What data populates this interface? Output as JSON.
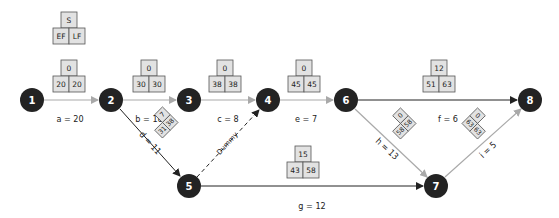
{
  "legend": {
    "top": "S",
    "left": "EF",
    "right": "LF"
  },
  "colors": {
    "node": "#232323",
    "edge_dark": "#222222",
    "edge_gray": "#a9a9a9",
    "box_fill": "#e2e2e2"
  },
  "nodes": [
    {
      "id": "1",
      "label": "1",
      "x": 32,
      "y": 100
    },
    {
      "id": "2",
      "label": "2",
      "x": 111,
      "y": 100
    },
    {
      "id": "3",
      "label": "3",
      "x": 189,
      "y": 100
    },
    {
      "id": "4",
      "label": "4",
      "x": 268,
      "y": 100
    },
    {
      "id": "5",
      "label": "5",
      "x": 189,
      "y": 186
    },
    {
      "id": "6",
      "label": "6",
      "x": 346,
      "y": 100
    },
    {
      "id": "7",
      "label": "7",
      "x": 436,
      "y": 186
    },
    {
      "id": "8",
      "label": "8",
      "x": 530,
      "y": 100
    }
  ],
  "edges": [
    {
      "id": "a",
      "from": "1",
      "to": "2",
      "label": "a = 20",
      "color": "gray",
      "slack": "0",
      "ef": "20",
      "lf": "20"
    },
    {
      "id": "b",
      "from": "2",
      "to": "3",
      "label": "b = 10",
      "color": "gray",
      "slack": "0",
      "ef": "30",
      "lf": "30"
    },
    {
      "id": "c",
      "from": "3",
      "to": "4",
      "label": "c = 8",
      "color": "gray",
      "slack": "0",
      "ef": "38",
      "lf": "38"
    },
    {
      "id": "d",
      "from": "2",
      "to": "5",
      "label": "d = 11",
      "color": "dark",
      "slack": "7",
      "ef": "31",
      "lf": "38"
    },
    {
      "id": "dummy",
      "from": "5",
      "to": "4",
      "label": "Dummy",
      "color": "dashed"
    },
    {
      "id": "e",
      "from": "4",
      "to": "6",
      "label": "e = 7",
      "color": "gray",
      "slack": "0",
      "ef": "45",
      "lf": "45"
    },
    {
      "id": "f",
      "from": "6",
      "to": "8",
      "label": "f = 6",
      "color": "dark",
      "slack": "12",
      "ef": "51",
      "lf": "63"
    },
    {
      "id": "g",
      "from": "5",
      "to": "7",
      "label": "g = 12",
      "color": "dark",
      "slack": "15",
      "ef": "43",
      "lf": "58"
    },
    {
      "id": "h",
      "from": "6",
      "to": "7",
      "label": "h = 13",
      "color": "gray",
      "slack": "0",
      "ef": "58",
      "lf": "58"
    },
    {
      "id": "i",
      "from": "7",
      "to": "8",
      "label": "i = 5",
      "color": "gray",
      "slack": "0",
      "ef": "63",
      "lf": "63"
    }
  ]
}
